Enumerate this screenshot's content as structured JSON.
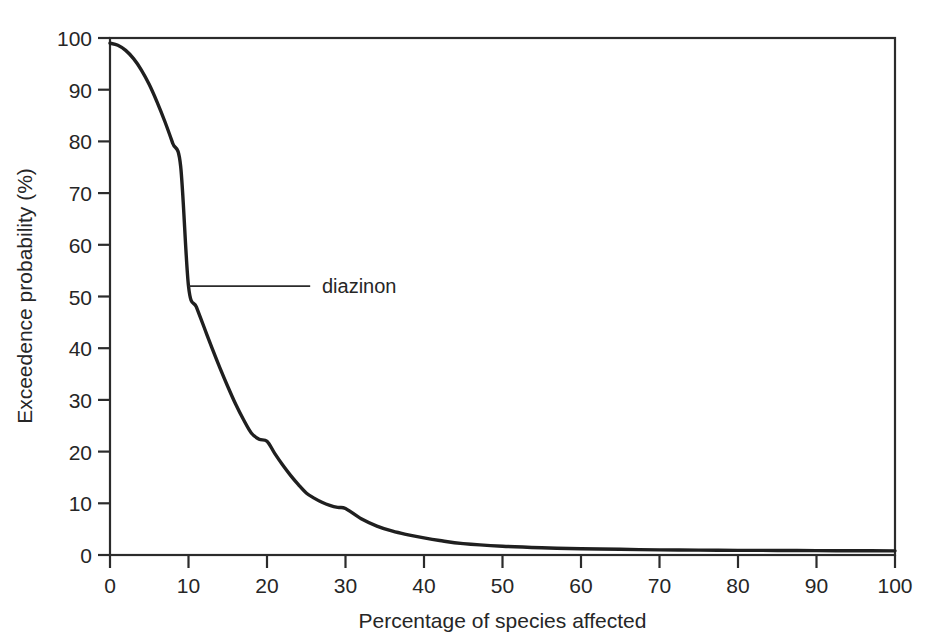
{
  "figure": {
    "background_color": "#ffffff",
    "axis_color": "#2b2b2b",
    "curve_color": "#1f1f1f"
  },
  "chart_data": {
    "type": "line",
    "title": "",
    "subtitle": "",
    "xlabel": "Percentage of species affected",
    "ylabel": "Exceedence probability (%)",
    "xlim": [
      0,
      100
    ],
    "ylim": [
      0,
      100
    ],
    "xticks": [
      0,
      10,
      20,
      30,
      40,
      50,
      60,
      70,
      80,
      90,
      100
    ],
    "yticks": [
      0,
      10,
      20,
      30,
      40,
      50,
      60,
      70,
      80,
      90,
      100
    ],
    "xtick_labels": [
      "0",
      "10",
      "20",
      "30",
      "40",
      "50",
      "60",
      "70",
      "80",
      "90",
      "100"
    ],
    "ytick_labels": [
      "0",
      "10",
      "20",
      "30",
      "40",
      "50",
      "60",
      "70",
      "80",
      "90",
      "100"
    ],
    "grid": false,
    "legend_position": "none",
    "series": [
      {
        "name": "diazinon",
        "color": "#1f1f1f",
        "x": [
          0,
          1,
          2,
          3,
          4,
          5,
          6,
          7,
          8,
          9,
          10,
          11,
          12,
          13,
          14,
          15,
          16,
          17,
          18,
          19,
          20,
          21,
          22,
          23,
          24,
          25,
          26,
          27,
          28,
          29,
          30,
          32,
          34,
          36,
          38,
          40,
          42,
          45,
          50,
          55,
          60,
          65,
          70,
          75,
          80,
          85,
          90,
          95,
          100
        ],
        "values": [
          99.0,
          98.6,
          97.6,
          96.0,
          93.8,
          91.0,
          87.6,
          83.8,
          79.6,
          75.2,
          52.0,
          48.0,
          44.0,
          40.0,
          36.2,
          32.6,
          29.2,
          26.2,
          23.6,
          22.4,
          22.0,
          19.6,
          17.4,
          15.4,
          13.6,
          12.0,
          11.0,
          10.2,
          9.6,
          9.2,
          9.0,
          7.0,
          5.6,
          4.6,
          3.9,
          3.3,
          2.8,
          2.2,
          1.7,
          1.4,
          1.2,
          1.1,
          1.0,
          0.95,
          0.9,
          0.88,
          0.85,
          0.82,
          0.8
        ]
      }
    ],
    "annotations": [
      {
        "text": "diazinon",
        "anchor_x": 10,
        "anchor_y": 52,
        "leader_to_x": 25.5,
        "label_x": 27
      }
    ]
  },
  "axes": {
    "y_title": "Exceedence probability (%)",
    "x_title": "Percentage of species affected"
  },
  "annotation": {
    "diazinon_label": "diazinon"
  }
}
